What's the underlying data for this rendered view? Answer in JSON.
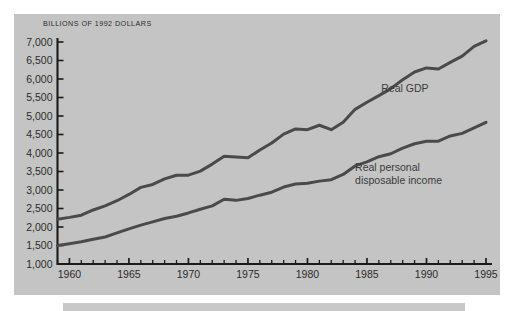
{
  "figure": {
    "background_color": "#ffffff",
    "panel_color": "#c4c4c4",
    "line_color": "#4a4a4a",
    "axis_color": "#1a1a1a",
    "text_color": "#2b2b2b"
  },
  "chart_data": {
    "type": "line",
    "title": "",
    "axis_title": "BILLIONS OF 1992 DOLLARS",
    "xlabel": "",
    "ylabel": "BILLIONS OF 1992 DOLLARS",
    "xlim": [
      1959,
      1995
    ],
    "ylim": [
      1000,
      7000
    ],
    "grid": false,
    "legend_position": "inline-annotation",
    "ytick_labels": [
      "7,000",
      "6,500",
      "6,000",
      "5,500",
      "5,000",
      "4,500",
      "4,000",
      "3,500",
      "3,000",
      "2,500",
      "2,000",
      "1,500",
      "1,000"
    ],
    "ytick_values": [
      7000,
      6500,
      6000,
      5500,
      5000,
      4500,
      4000,
      3500,
      3000,
      2500,
      2000,
      1500,
      1000
    ],
    "xtick_labels": [
      "1960",
      "1965",
      "1970",
      "1975",
      "1980",
      "1985",
      "1990",
      "1995"
    ],
    "xtick_values": [
      1960,
      1965,
      1970,
      1975,
      1980,
      1985,
      1990,
      1995
    ],
    "minor_xticks": "annual",
    "x": [
      1959,
      1960,
      1961,
      1962,
      1963,
      1964,
      1965,
      1966,
      1967,
      1968,
      1969,
      1970,
      1971,
      1972,
      1973,
      1974,
      1975,
      1976,
      1977,
      1978,
      1979,
      1980,
      1981,
      1982,
      1983,
      1984,
      1985,
      1986,
      1987,
      1988,
      1989,
      1990,
      1991,
      1992,
      1993,
      1994,
      1995
    ],
    "series": [
      {
        "name": "Real GDP",
        "label": "Real GDP",
        "label_x": 1986.2,
        "label_y": 5760,
        "values": [
          2210,
          2260,
          2320,
          2460,
          2570,
          2710,
          2880,
          3070,
          3150,
          3300,
          3400,
          3400,
          3510,
          3700,
          3910,
          3890,
          3870,
          4080,
          4270,
          4510,
          4650,
          4630,
          4750,
          4630,
          4830,
          5180,
          5370,
          5550,
          5740,
          5980,
          6190,
          6300,
          6270,
          6450,
          6620,
          6880,
          7030
        ]
      },
      {
        "name": "Real personal disposable income",
        "label_lines": [
          "Real personal",
          "disposable income"
        ],
        "label_x": 1984.0,
        "label_y": 3450,
        "values": [
          1500,
          1550,
          1600,
          1670,
          1730,
          1840,
          1950,
          2050,
          2140,
          2230,
          2290,
          2380,
          2480,
          2570,
          2750,
          2720,
          2770,
          2860,
          2940,
          3080,
          3160,
          3180,
          3240,
          3280,
          3420,
          3650,
          3760,
          3900,
          3980,
          4130,
          4250,
          4320,
          4320,
          4460,
          4530,
          4680,
          4830
        ]
      }
    ]
  }
}
